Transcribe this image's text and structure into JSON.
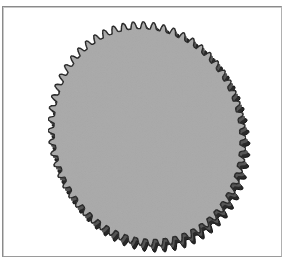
{
  "figure": {
    "teeth_count": 60,
    "colors": {
      "face": "#a9a9a9",
      "teeth_shadow": "#2a2a2a",
      "teeth_highlight": "#555555",
      "frame_border": "#8a8a8a",
      "background": "#ffffff"
    }
  }
}
